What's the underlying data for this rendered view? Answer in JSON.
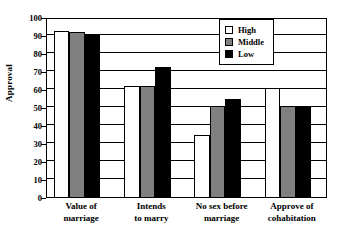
{
  "chart_data": {
    "type": "bar",
    "title": "",
    "xlabel": "",
    "ylabel": "Approval",
    "ylim": [
      0,
      100
    ],
    "ytick_step": 10,
    "yticks": [
      100,
      90,
      80,
      70,
      60,
      50,
      40,
      30,
      20,
      10,
      0
    ],
    "grid": true,
    "legend_position": "top-right",
    "categories": [
      "Value of marriage",
      "Intends to marry",
      "No sex before marriage",
      "Approve of cohabitation"
    ],
    "category_lines": [
      [
        "Value of",
        "marriage"
      ],
      [
        "Intends",
        "to marry"
      ],
      [
        "No sex before",
        "marriage"
      ],
      [
        "Approve of",
        "cohabitation"
      ]
    ],
    "series": [
      {
        "name": "High",
        "color": "#ffffff",
        "values": [
          93,
          62,
          35,
          61
        ]
      },
      {
        "name": "Middle",
        "color": "#808080",
        "values": [
          92,
          62,
          51,
          51
        ]
      },
      {
        "name": "Low",
        "color": "#000000",
        "values": [
          91,
          73,
          55,
          51
        ]
      }
    ]
  },
  "legend": {
    "items": [
      {
        "label": "High",
        "key": "high"
      },
      {
        "label": "Middle",
        "key": "middle"
      },
      {
        "label": "Low",
        "key": "low"
      }
    ]
  },
  "colors": {
    "axis": "#000000",
    "background": "#ffffff",
    "high": "#ffffff",
    "middle": "#808080",
    "low": "#000000"
  }
}
